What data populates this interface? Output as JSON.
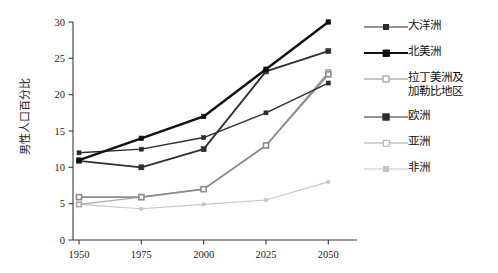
{
  "chart_data": {
    "type": "line",
    "title": "",
    "xlabel": "",
    "ylabel": "男性人口百分比",
    "categories": [
      "1950",
      "1975",
      "2000",
      "2025",
      "2050"
    ],
    "x": [
      1950,
      1975,
      2000,
      2025,
      2050
    ],
    "xlim": [
      1938,
      2062
    ],
    "ylim": [
      0,
      30
    ],
    "yticks": [
      "0",
      "5",
      "10",
      "15",
      "20",
      "25",
      "30"
    ],
    "ytick_values": [
      0,
      5,
      10,
      15,
      20,
      25,
      30
    ],
    "xticks": [
      "1950",
      "1975",
      "2000",
      "2025",
      "2050"
    ],
    "grid": false,
    "legend_position": "right",
    "series": [
      {
        "name": "大洋洲",
        "values": [
          12.0,
          12.5,
          14.1,
          17.5,
          21.6
        ],
        "color": "#2b2b2b",
        "line_width": 1.4,
        "marker": "filled-square",
        "marker_size": 4
      },
      {
        "name": "北美洲",
        "values": [
          11.0,
          14.0,
          17.0,
          23.5,
          30.0
        ],
        "color": "#111111",
        "line_width": 2.4,
        "marker": "filled-square",
        "marker_size": 4.5
      },
      {
        "name": "拉丁美洲及\n加勒比地区",
        "values": [
          5.9,
          5.9,
          7.0,
          13.0,
          22.8
        ],
        "color": "#8c8c8c",
        "line_width": 1.8,
        "marker": "open-square",
        "marker_size": 5
      },
      {
        "name": "欧洲",
        "values": [
          10.9,
          10.0,
          12.5,
          23.2,
          26.0
        ],
        "color": "#2f2f2f",
        "line_width": 1.8,
        "marker": "filled-square",
        "marker_size": 5
      },
      {
        "name": "亚洲",
        "values": [
          4.9,
          5.9,
          7.0,
          13.0,
          23.1
        ],
        "color": "#a8a8a8",
        "line_width": 1.3,
        "marker": "open-square",
        "marker_size": 4.5
      },
      {
        "name": "非洲",
        "values": [
          4.9,
          4.3,
          4.9,
          5.5,
          8.0
        ],
        "color": "#c6c6c6",
        "line_width": 1.1,
        "marker": "small-square",
        "marker_size": 3
      }
    ]
  },
  "legend": {
    "items": [
      {
        "label": "大洋洲"
      },
      {
        "label": "北美洲"
      },
      {
        "label": "拉丁美洲及\n加勒比地区"
      },
      {
        "label": "欧洲"
      },
      {
        "label": "亚洲"
      },
      {
        "label": "非洲"
      }
    ]
  },
  "axes": {
    "y_title": "男性人口百分比",
    "y_labels": [
      "30",
      "25",
      "20",
      "15",
      "10",
      "5",
      "0"
    ],
    "x_labels": [
      "1950",
      "1975",
      "2000",
      "2025",
      "2050"
    ]
  }
}
